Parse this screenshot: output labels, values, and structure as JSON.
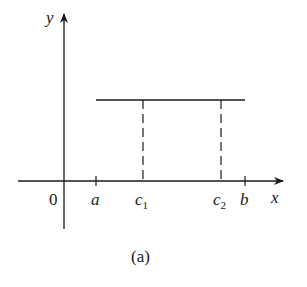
{
  "diagram": {
    "axis_labels": {
      "y": "y",
      "x": "x",
      "origin": "0"
    },
    "tick_labels": {
      "a": "a",
      "c1": "c",
      "c1_sub": "1",
      "c2": "c",
      "c2_sub": "2",
      "b": "b"
    },
    "caption": "(a)",
    "stroke_color": "#1a1a1a"
  }
}
